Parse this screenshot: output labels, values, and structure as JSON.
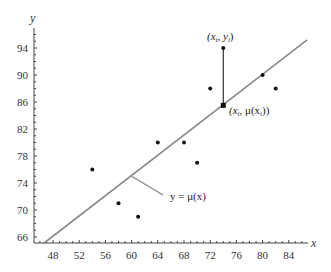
{
  "chart_data": {
    "type": "scatter",
    "title": "",
    "xlabel": "x",
    "ylabel": "y",
    "xlim": [
      45,
      87
    ],
    "ylim": [
      65,
      97
    ],
    "grid": false,
    "x_ticks": [
      48,
      52,
      56,
      60,
      64,
      68,
      72,
      76,
      80,
      84
    ],
    "y_ticks": [
      66,
      70,
      74,
      78,
      82,
      86,
      90,
      94
    ],
    "series": [
      {
        "name": "observations",
        "marker": "circle",
        "points": [
          {
            "x": 54,
            "y": 76
          },
          {
            "x": 58,
            "y": 71
          },
          {
            "x": 61,
            "y": 69
          },
          {
            "x": 64,
            "y": 80
          },
          {
            "x": 68,
            "y": 80
          },
          {
            "x": 70,
            "y": 77
          },
          {
            "x": 72,
            "y": 88
          },
          {
            "x": 74,
            "y": 94
          },
          {
            "x": 80,
            "y": 90
          },
          {
            "x": 82,
            "y": 88
          }
        ]
      },
      {
        "name": "regression line",
        "type": "line",
        "label": "y = μ(x)",
        "points": [
          {
            "x": 46.5,
            "y": 65
          },
          {
            "x": 86.8,
            "y": 95.2
          }
        ]
      },
      {
        "name": "fitted value",
        "marker": "square",
        "points": [
          {
            "x": 74,
            "y": 85.5
          }
        ]
      }
    ],
    "annotations": [
      {
        "text": "(xᵢ, yᵢ)",
        "x": 74,
        "y": 94,
        "position": "above"
      },
      {
        "text": "(xᵢ, μ(xᵢ))",
        "x": 74,
        "y": 85.5,
        "position": "right"
      },
      {
        "text": "y = μ(x)",
        "pointer_from": {
          "x": 60,
          "y": 75
        },
        "position": "below-right"
      },
      {
        "text": "residual segment",
        "from": {
          "x": 74,
          "y": 94
        },
        "to": {
          "x": 74,
          "y": 85.5
        }
      }
    ],
    "legend": null
  },
  "labels": {
    "x_axis": "x",
    "y_axis": "y",
    "point_label": "(x",
    "point_label_sub": "i",
    "point_label_mid": ", y",
    "point_label_sub2": "i",
    "point_label_end": ")",
    "fit_label_start": "(x",
    "fit_label_sub": "i",
    "fit_label_mid": ", μ(x",
    "fit_label_sub2": "i",
    "fit_label_end": "))",
    "line_label": "y = μ(x)"
  },
  "colors": {
    "axis": "#444444",
    "line": "#8a8a8a",
    "points": "#111111",
    "text": "#333333"
  }
}
